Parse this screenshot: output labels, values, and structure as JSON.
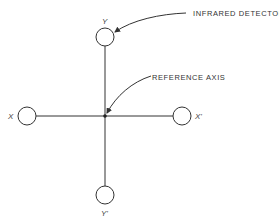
{
  "diagram": {
    "type": "detector-array-layout",
    "colors": {
      "stroke": "#333333",
      "background": "#ffffff"
    },
    "center": {
      "x": 105,
      "y": 116
    },
    "detectors": [
      {
        "id": "Y",
        "label": "Y",
        "cx": 105,
        "cy": 37,
        "r": 9
      },
      {
        "id": "Y'",
        "label": "Y'",
        "cx": 105,
        "cy": 195,
        "r": 9
      },
      {
        "id": "X",
        "label": "X",
        "cx": 27,
        "cy": 116,
        "r": 9
      },
      {
        "id": "X'",
        "label": "X'",
        "cx": 182,
        "cy": 116,
        "r": 9
      }
    ],
    "callouts": {
      "infrared_detector": "INFRARED DETECTOR",
      "reference_axis": "REFERENCE AXIS"
    }
  }
}
